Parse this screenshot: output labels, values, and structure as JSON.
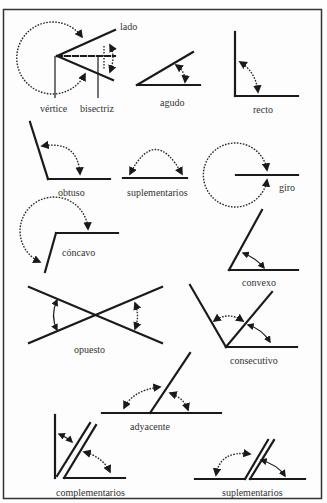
{
  "diagram": {
    "frame": {
      "border_color": "#333333",
      "background": "#fdfdfd"
    },
    "labels": {
      "lado": "lado",
      "vertice": "vértice",
      "bisectriz": "bisectriz",
      "agudo": "agudo",
      "recto": "recto",
      "obtuso": "obtuso",
      "suplementarios_1": "suplementarios",
      "giro": "giro",
      "concavo": "cóncavo",
      "convexo": "convexo",
      "opuesto": "opuesto",
      "consecutivo": "consecutivo",
      "adyacente": "adyacente",
      "complementarios": "complementarios",
      "suplementarios_2": "suplementarios"
    }
  }
}
